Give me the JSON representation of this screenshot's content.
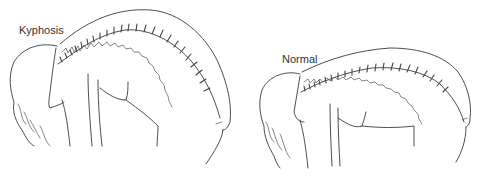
{
  "figure": {
    "panels": [
      {
        "id": "left",
        "label": "Kyphosis",
        "description": "Forward-bending figure with exaggerated, sharply rounded thoracic spine curvature"
      },
      {
        "id": "right",
        "label": "Normal",
        "description": "Forward-bending figure with smooth, gently arched normal spine curvature"
      }
    ],
    "colors": {
      "line": "#3a3a3a",
      "background": "#ffffff",
      "label": "#333333"
    }
  }
}
